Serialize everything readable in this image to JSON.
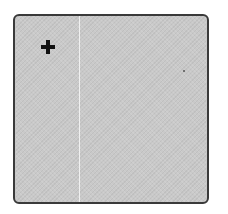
{
  "panel": {
    "background_color": "#c9c9c9",
    "border_color": "#3a3a3a",
    "divider_color": "#f4f4f4"
  },
  "add_button": {
    "icon": "plus-icon",
    "color": "#111111"
  }
}
